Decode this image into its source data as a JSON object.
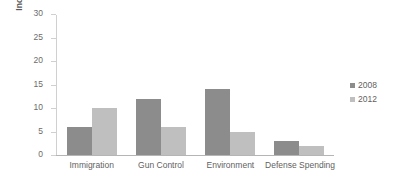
{
  "chart_data": {
    "type": "bar",
    "title": "",
    "xlabel": "",
    "ylabel": "Income Gap (%)",
    "categories": [
      "Immigration",
      "Gun Control",
      "Environment",
      "Defense Spending"
    ],
    "series": [
      {
        "name": "2008",
        "color": "#8c8c8c",
        "values": [
          6,
          12,
          14,
          3
        ]
      },
      {
        "name": "2012",
        "color": "#bfbfbf",
        "values": [
          10,
          6,
          5,
          2
        ]
      }
    ],
    "ylim": [
      0,
      30
    ],
    "ytick_step": 5,
    "yticks": [
      0,
      5,
      10,
      15,
      20,
      25,
      30
    ],
    "ytick_labels": [
      "0",
      "5",
      "10",
      "15",
      "20",
      "25",
      "30"
    ],
    "grid": false,
    "legend_position": "right",
    "legend_entries": [
      "2008",
      "2012"
    ],
    "background_color": "#ffffff",
    "axis_color": "#b5b5b5",
    "text_color": "#5f5f5f"
  }
}
